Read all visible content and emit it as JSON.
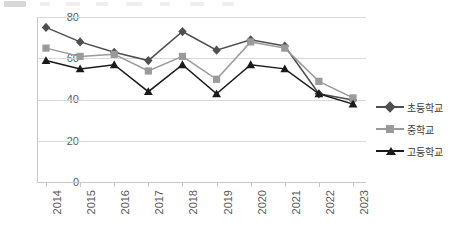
{
  "chart_data": {
    "type": "line",
    "title": "",
    "xlabel": "",
    "ylabel": "",
    "categories": [
      "2014",
      "2015",
      "2016",
      "2017",
      "2018",
      "2019",
      "2020",
      "2021",
      "2022",
      "2023"
    ],
    "series": [
      {
        "name": "초등학교",
        "marker": "diamond",
        "color": "#4f4f4f",
        "values": [
          75,
          68,
          63,
          59,
          73,
          64,
          69,
          66,
          43,
          40
        ]
      },
      {
        "name": "중학교",
        "marker": "square",
        "color": "#9a9a9a",
        "values": [
          65,
          61,
          62,
          54,
          61,
          50,
          68,
          65,
          49,
          41
        ]
      },
      {
        "name": "고등학교",
        "marker": "triangle",
        "color": "#1a1a1a",
        "values": [
          59,
          55,
          57,
          44,
          57,
          43,
          57,
          55,
          43,
          38
        ]
      }
    ],
    "ylim": [
      0,
      80
    ],
    "yticks": [
      0,
      20,
      40,
      60,
      80
    ],
    "ytick_labels": [
      "0",
      "20",
      "40",
      "60",
      "80"
    ],
    "grid": true,
    "grid_axis": "y",
    "legend_position": "right",
    "xtick_rotation": -90
  },
  "legend": {
    "items": [
      {
        "label": "초등학교"
      },
      {
        "label": "중학교"
      },
      {
        "label": "고등학교"
      }
    ]
  }
}
